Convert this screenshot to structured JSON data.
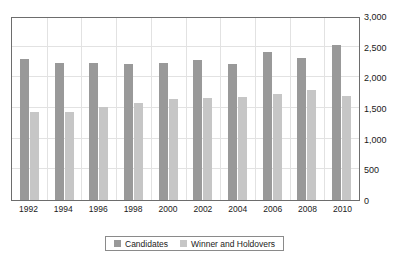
{
  "title": "",
  "legend": {
    "position": "bottom",
    "entries": [
      {
        "label": "Candidates",
        "color": "#999999",
        "swatch_name": "legend-swatch-candidates"
      },
      {
        "label": "Winner and Holdovers",
        "color": "#c6c6c6",
        "swatch_name": "legend-swatch-winner-holdovers"
      }
    ]
  },
  "axis": {
    "y_ticks": [
      "0",
      "500",
      "1,000",
      "1,500",
      "2,000",
      "2,500",
      "3,000"
    ],
    "y_position": "right"
  },
  "colors": {
    "candidates": "#999999",
    "winner_and_holdovers": "#c6c6c6",
    "gridline": "#e2e2e2",
    "frame": "#6d6d6d",
    "background": "#ffffff"
  },
  "chart_data": {
    "type": "bar",
    "title": "",
    "xlabel": "",
    "ylabel": "",
    "ylim": [
      0,
      3000
    ],
    "ytick_values": [
      0,
      500,
      1000,
      1500,
      2000,
      2500,
      3000
    ],
    "grid": true,
    "legend_position": "bottom",
    "categories": [
      "1992",
      "1994",
      "1996",
      "1998",
      "2000",
      "2002",
      "2004",
      "2006",
      "2008",
      "2010"
    ],
    "series": [
      {
        "name": "Candidates",
        "color": "#999999",
        "values": [
          2300,
          2230,
          2230,
          2210,
          2230,
          2280,
          2220,
          2420,
          2320,
          2520
        ]
      },
      {
        "name": "Winner and Holdovers",
        "color": "#c6c6c6",
        "values": [
          1440,
          1440,
          1510,
          1580,
          1640,
          1660,
          1680,
          1730,
          1800,
          1700
        ]
      }
    ]
  }
}
